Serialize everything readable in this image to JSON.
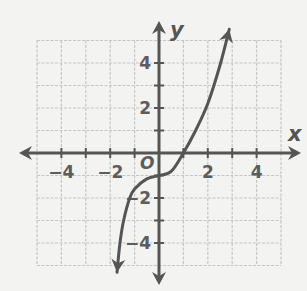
{
  "chart_data": {
    "type": "line",
    "title": "",
    "xlabel": "x",
    "ylabel": "y",
    "origin_label": "O",
    "xlim": [
      -5,
      5
    ],
    "ylim": [
      -5,
      5
    ],
    "grid": true,
    "grid_step": 1,
    "x_ticks": [
      -4,
      -2,
      2,
      4
    ],
    "y_ticks": [
      4,
      2,
      -2,
      -4
    ],
    "x_tick_labels": [
      "−4",
      "−2",
      "2",
      "4"
    ],
    "y_tick_labels": [
      "4",
      "2",
      "−2",
      "−4"
    ],
    "series": [
      {
        "name": "curve",
        "arrows_both_ends": true,
        "points": [
          [
            -1.72,
            -5.3
          ],
          [
            -1.6,
            -4.0
          ],
          [
            -1.45,
            -3.0
          ],
          [
            -1.2,
            -2.0
          ],
          [
            -1.0,
            -1.6
          ],
          [
            -0.5,
            -1.15
          ],
          [
            0.0,
            -1.0
          ],
          [
            0.5,
            -0.82
          ],
          [
            1.0,
            0.0
          ],
          [
            1.5,
            1.0
          ],
          [
            2.0,
            2.2
          ],
          [
            2.5,
            3.9
          ],
          [
            2.88,
            5.5
          ]
        ]
      }
    ],
    "colors": {
      "axis": "#555555",
      "curve": "#555555",
      "grid": "#c6c6c6",
      "text": "#5c5c5c",
      "background": "#f3f3f2"
    }
  }
}
